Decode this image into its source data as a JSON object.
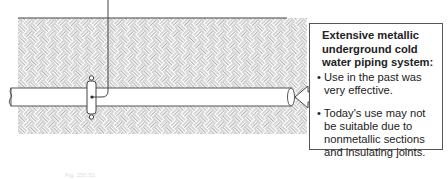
{
  "figure": {
    "type": "diagram",
    "colors": {
      "line": "#555555",
      "hatch": "#8a8a8a",
      "background": "#ffffff"
    }
  },
  "callout": {
    "title": "Extensive metallic underground cold water piping system:",
    "bullets": [
      "Use in the past was very effective.",
      "Today's use may not be suitable due to nonmetallic sections and insulating joints."
    ]
  },
  "caption": {
    "text": "Fig. 250.52"
  }
}
